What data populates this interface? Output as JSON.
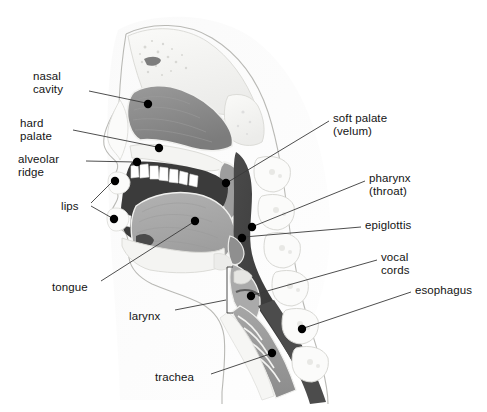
{
  "figure": {
    "background_color": "#ffffff",
    "line_color": "#3a3a3a",
    "dot_color": "#000000",
    "text_color": "#141414",
    "width": 487,
    "height": 412
  },
  "palette": {
    "nasal_mucosa": "#8f8f8f",
    "nasal_mucosa_dark": "#7a7a7a",
    "oral_cavity_dark": "#3b3b3b",
    "pharynx_dark": "#3f3f3f",
    "tongue": "#a8a8a8",
    "tongue_dark": "#4a4a4a",
    "bone_light": "#f2f2f0",
    "bone_outline": "#d3d3cf",
    "cartilage": "#cfcfcf",
    "teeth": "#ffffff",
    "skin_outline": "#b9b9b5",
    "trachea_mid": "#9a9a9a",
    "esophagus_dark": "#4c4c4c"
  },
  "labels": [
    {
      "id": "nasal-cavity",
      "lines": [
        "nasal",
        "cavity"
      ],
      "text_x": 33,
      "text_y": 70,
      "align": "left",
      "width": 60,
      "leaders": [
        {
          "x1": 89,
          "y1": 91,
          "x2": 146,
          "y2": 103
        }
      ],
      "dots": [
        {
          "cx": 148,
          "cy": 104
        }
      ]
    },
    {
      "id": "hard-palate",
      "lines": [
        "hard",
        "palate"
      ],
      "text_x": 20,
      "text_y": 117,
      "align": "left",
      "width": 62,
      "leaders": [
        {
          "x1": 73,
          "y1": 130,
          "x2": 157,
          "y2": 147
        }
      ],
      "dots": [
        {
          "cx": 159,
          "cy": 148
        }
      ]
    },
    {
      "id": "alveolar-ridge",
      "lines": [
        "alveolar",
        "ridge"
      ],
      "text_x": 18,
      "text_y": 153,
      "align": "left",
      "width": 66,
      "leaders": [
        {
          "x1": 86,
          "y1": 161,
          "x2": 135,
          "y2": 162
        }
      ],
      "dots": [
        {
          "cx": 137,
          "cy": 162
        }
      ]
    },
    {
      "id": "lips",
      "lines": [
        "lips"
      ],
      "text_x": 61,
      "text_y": 200,
      "align": "left",
      "width": 26,
      "leaders": [
        {
          "x1": 91,
          "y1": 203,
          "x2": 112,
          "y2": 182
        },
        {
          "x1": 91,
          "y1": 206,
          "x2": 112,
          "y2": 218
        }
      ],
      "dots": [
        {
          "cx": 115,
          "cy": 181
        },
        {
          "cx": 114,
          "cy": 219
        }
      ]
    },
    {
      "id": "tongue",
      "lines": [
        "tongue"
      ],
      "text_x": 52,
      "text_y": 281,
      "align": "left",
      "width": 46,
      "leaders": [
        {
          "x1": 101,
          "y1": 281,
          "x2": 192,
          "y2": 223
        }
      ],
      "dots": [
        {
          "cx": 195,
          "cy": 221
        }
      ]
    },
    {
      "id": "larynx",
      "lines": [
        "larynx"
      ],
      "text_x": 129,
      "text_y": 310,
      "align": "left",
      "width": 42,
      "leaders": [
        {
          "x1": 175,
          "y1": 310,
          "x2": 226,
          "y2": 300
        }
      ],
      "dots": [],
      "bracket": {
        "x": 227,
        "y_top": 267,
        "y_bottom": 313,
        "arm": 6
      }
    },
    {
      "id": "trachea",
      "lines": [
        "trachea"
      ],
      "text_x": 155,
      "text_y": 371,
      "align": "left",
      "width": 50,
      "leaders": [
        {
          "x1": 211,
          "y1": 374,
          "x2": 270,
          "y2": 354
        }
      ],
      "dots": [
        {
          "cx": 272,
          "cy": 353
        }
      ]
    },
    {
      "id": "soft-palate-velum",
      "lines": [
        "soft palate",
        "(velum)"
      ],
      "text_x": 333,
      "text_y": 112,
      "align": "left",
      "width": 80,
      "leaders": [
        {
          "x1": 329,
          "y1": 121,
          "x2": 228,
          "y2": 182
        }
      ],
      "dots": [
        {
          "cx": 226,
          "cy": 183
        }
      ]
    },
    {
      "id": "pharynx-throat",
      "lines": [
        "pharynx",
        "(throat)"
      ],
      "text_x": 369,
      "text_y": 172,
      "align": "left",
      "width": 64,
      "leaders": [
        {
          "x1": 365,
          "y1": 181,
          "x2": 254,
          "y2": 226
        }
      ],
      "dots": [
        {
          "cx": 252,
          "cy": 227
        }
      ]
    },
    {
      "id": "epiglottis",
      "lines": [
        "epiglottis"
      ],
      "text_x": 365,
      "text_y": 219,
      "align": "left",
      "width": 60,
      "leaders": [
        {
          "x1": 361,
          "y1": 227,
          "x2": 244,
          "y2": 237
        }
      ],
      "dots": [
        {
          "cx": 242,
          "cy": 238
        }
      ]
    },
    {
      "id": "vocal-cords",
      "lines": [
        "vocal",
        "cords"
      ],
      "text_x": 381,
      "text_y": 251,
      "align": "left",
      "width": 44,
      "leaders": [
        {
          "x1": 377,
          "y1": 260,
          "x2": 253,
          "y2": 295
        }
      ],
      "dots": [
        {
          "cx": 251,
          "cy": 296
        }
      ]
    },
    {
      "id": "esophagus",
      "lines": [
        "esophagus"
      ],
      "text_x": 415,
      "text_y": 284,
      "align": "left",
      "width": 68,
      "leaders": [
        {
          "x1": 411,
          "y1": 292,
          "x2": 304,
          "y2": 328
        }
      ],
      "dots": [
        {
          "cx": 302,
          "cy": 329
        }
      ]
    }
  ]
}
